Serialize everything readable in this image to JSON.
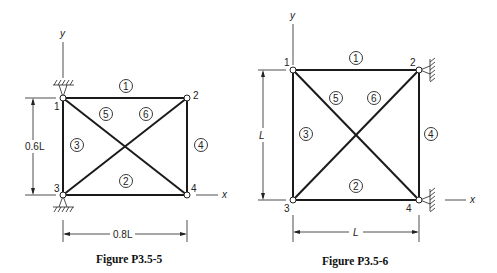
{
  "figures": [
    {
      "caption": "Figure P3.5-5",
      "axes": {
        "x": "x",
        "y": "y"
      },
      "dimensions": {
        "height": "0.6L",
        "width": "0.8L"
      },
      "nodes": [
        "1",
        "2",
        "3",
        "4"
      ],
      "elements": [
        "1",
        "2",
        "3",
        "4",
        "5",
        "6"
      ],
      "supports": "pin supports at nodes 1 and 3 (vertical wall hatching)"
    },
    {
      "caption": "Figure P3.5-6",
      "axes": {
        "x": "x",
        "y": "y"
      },
      "dimensions": {
        "height": "L",
        "width": "L"
      },
      "nodes": [
        "1",
        "2",
        "3",
        "4"
      ],
      "elements": [
        "1",
        "2",
        "3",
        "4",
        "5",
        "6"
      ],
      "supports": "pin supports at nodes 2 and 4 (side wall hatching)"
    }
  ]
}
